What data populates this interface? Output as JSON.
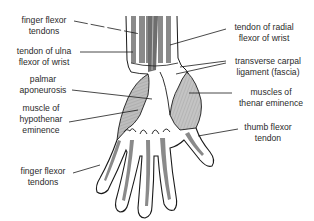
{
  "diagram": {
    "colors": {
      "outline": "#1a1a1a",
      "tendon": "#8a8a8a",
      "muscle": "#b8b8b8",
      "background": "#ffffff"
    },
    "labels": {
      "finger_flexor_tendons_top": [
        "finger flexor",
        "tendons"
      ],
      "tendon_ulna_flexor": [
        "tendon of ulna",
        "flexor of wrist"
      ],
      "palmar_aponeurosis": [
        "palmar",
        "aponeurosis"
      ],
      "muscle_hypothenar": [
        "muscle of",
        "hypothenar",
        "eminence"
      ],
      "finger_flexor_tendons_bottom": [
        "finger flexor",
        "tendons"
      ],
      "tendon_radial_flexor": [
        "tendon of radial",
        "flexor of wrist"
      ],
      "transverse_carpal_ligament": [
        "transverse carpal",
        "ligament (fascia)"
      ],
      "muscles_thenar": [
        "muscles of",
        "thenar eminence"
      ],
      "thumb_flexor_tendon": [
        "thumb flexor",
        "tendon"
      ]
    }
  }
}
